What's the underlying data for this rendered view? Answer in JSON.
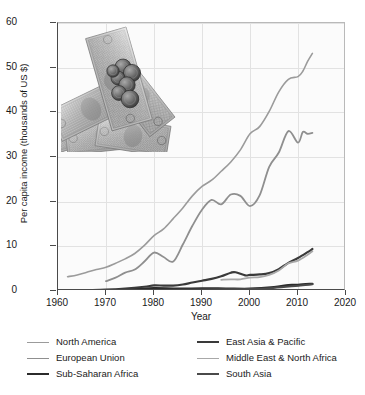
{
  "chart_data": {
    "type": "line",
    "title": "",
    "xlabel": "Year",
    "ylabel": "Per capita income (thousands of US $)",
    "xlim": [
      1960,
      2020
    ],
    "ylim": [
      0,
      60
    ],
    "xticks": [
      1960,
      1970,
      1980,
      1990,
      2000,
      2010,
      2020
    ],
    "yticks": [
      0,
      10,
      20,
      30,
      40,
      50,
      60
    ],
    "grid": true,
    "legend_position": "below-plot-two-columns",
    "units": "thousands of US $",
    "series": [
      {
        "name": "North America",
        "color": "#9b9b9b",
        "x": [
          1962,
          1964,
          1966,
          1968,
          1970,
          1972,
          1974,
          1976,
          1978,
          1980,
          1982,
          1984,
          1986,
          1988,
          1990,
          1992,
          1994,
          1996,
          1998,
          2000,
          2002,
          2004,
          2006,
          2008,
          2010,
          2011,
          2012,
          2013
        ],
        "values": [
          3.2,
          3.6,
          4.2,
          4.8,
          5.3,
          6.2,
          7.2,
          8.4,
          10.2,
          12.4,
          13.9,
          16.2,
          18.6,
          21.3,
          23.4,
          24.8,
          26.8,
          28.9,
          31.6,
          35.2,
          36.8,
          40.2,
          44.6,
          47.4,
          48.0,
          49.2,
          51.4,
          53.2
        ]
      },
      {
        "name": "European Union",
        "color": "#8f8f8f",
        "x": [
          1970,
          1972,
          1974,
          1976,
          1978,
          1980,
          1982,
          1984,
          1986,
          1988,
          1990,
          1992,
          1994,
          1996,
          1998,
          2000,
          2002,
          2004,
          2006,
          2008,
          2010,
          2011,
          2012,
          2013
        ],
        "values": [
          2.2,
          3.0,
          4.1,
          4.8,
          6.6,
          8.6,
          7.6,
          6.6,
          10.4,
          14.6,
          18.2,
          20.4,
          19.4,
          21.6,
          21.3,
          19.0,
          21.4,
          27.8,
          31.0,
          35.8,
          33.2,
          35.6,
          35.2,
          35.4
        ]
      },
      {
        "name": "Sub-Saharan Africa",
        "color": "#2b2b2b",
        "x": [
          1962,
          1970,
          1975,
          1980,
          1985,
          1990,
          1995,
          2000,
          2005,
          2008,
          2010,
          2013
        ],
        "values": [
          0.14,
          0.2,
          0.35,
          0.62,
          0.5,
          0.58,
          0.54,
          0.5,
          0.85,
          1.32,
          1.35,
          1.6
        ]
      },
      {
        "name": "East Asia & Pacific",
        "color": "#3a3a3a",
        "x": [
          1962,
          1966,
          1970,
          1974,
          1978,
          1980,
          1982,
          1984,
          1986,
          1988,
          1990,
          1992,
          1994,
          1996,
          1997,
          1999,
          2000,
          2002,
          2004,
          2006,
          2008,
          2010,
          2012,
          2013
        ],
        "values": [
          0.12,
          0.2,
          0.3,
          0.55,
          0.95,
          1.25,
          1.2,
          1.2,
          1.45,
          1.9,
          2.3,
          2.7,
          3.3,
          4.1,
          4.2,
          3.5,
          3.6,
          3.7,
          4.0,
          4.9,
          6.3,
          7.4,
          8.7,
          9.4
        ]
      },
      {
        "name": "Middle East & North Africa",
        "color": "#a8a8a8",
        "x": [
          1994,
          1996,
          1998,
          2000,
          2002,
          2004,
          2006,
          2008,
          2010,
          2012,
          2013
        ],
        "values": [
          2.5,
          2.6,
          2.6,
          3.0,
          3.1,
          3.6,
          4.6,
          6.2,
          6.8,
          8.1,
          8.9
        ]
      },
      {
        "name": "South Asia",
        "color": "#4a4a4a",
        "x": [
          1962,
          1970,
          1980,
          1990,
          2000,
          2005,
          2010,
          2013
        ],
        "values": [
          0.1,
          0.12,
          0.22,
          0.35,
          0.45,
          0.7,
          1.2,
          1.5
        ]
      }
    ]
  },
  "legend": {
    "left_column": [
      {
        "label": "North America",
        "color": "#9b9b9b",
        "width": 1.6
      },
      {
        "label": "European Union",
        "color": "#8f8f8f",
        "width": 1.8
      },
      {
        "label": "Sub-Saharan Africa",
        "color": "#2b2b2b",
        "width": 2.4
      }
    ],
    "right_column": [
      {
        "label": "East Asia & Pacific",
        "color": "#3a3a3a",
        "width": 2.2
      },
      {
        "label": "Middle East & North Africa",
        "color": "#a8a8a8",
        "width": 1.8
      },
      {
        "label": "South Asia",
        "color": "#4a4a4a",
        "width": 2.0
      }
    ]
  },
  "overlay_image": {
    "name": "us-currency-photo",
    "description": "Grayscale photograph of US dollar banknotes fanned out with coins on top"
  }
}
